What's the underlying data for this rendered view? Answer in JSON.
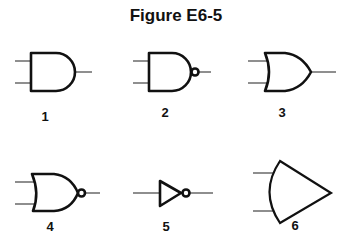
{
  "figure": {
    "title": "Figure E6-5"
  },
  "gates": [
    {
      "label": "1",
      "symbol": "and-gate"
    },
    {
      "label": "2",
      "symbol": "nand-gate"
    },
    {
      "label": "3",
      "symbol": "or-gate"
    },
    {
      "label": "4",
      "symbol": "nor-gate"
    },
    {
      "label": "5",
      "symbol": "not-gate"
    },
    {
      "label": "6",
      "symbol": "non-standard-gate"
    }
  ]
}
